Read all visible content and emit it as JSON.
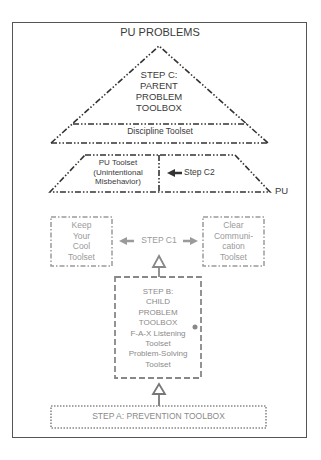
{
  "title": "PU PROBLEMS",
  "step_c": {
    "lines": [
      "STEP C:",
      "PARENT",
      "PROBLEM",
      "TOOLBOX"
    ],
    "discipline": "Discipline Toolset"
  },
  "pu_section": {
    "toolset_lines": [
      "PU Toolset",
      "(Unintentional",
      "Misbehavior)"
    ],
    "step_c2": "Step C2",
    "side_label": "PU"
  },
  "step_c1": {
    "label": "STEP C1",
    "left_box_lines": [
      "Keep",
      "Your",
      "Cool",
      "Toolset"
    ],
    "right_box_lines": [
      "Clear",
      "Communi-",
      "cation",
      "Toolset"
    ]
  },
  "step_b": {
    "lines": [
      "STEP B:",
      "CHILD",
      "PROBLEM",
      "TOOLBOX",
      "F-A-X Listening",
      "Toolset",
      "Problem-Solving",
      "Toolset"
    ]
  },
  "step_a": {
    "label": "STEP A: PREVENTION TOOLBOX"
  },
  "colors": {
    "dark": "#3a3a3a",
    "gray": "#9a9a9a",
    "border": "#555555"
  }
}
